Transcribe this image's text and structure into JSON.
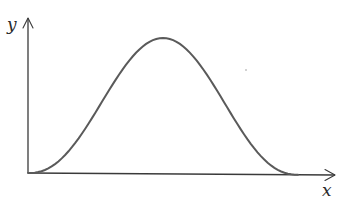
{
  "diagram": {
    "type": "function-plot",
    "axes": {
      "x_label": "x",
      "y_label": "y"
    },
    "curve": {
      "shape": "bell",
      "starts_at": "origin",
      "peak_position": "center",
      "returns_to_axis": "right",
      "samples": 80
    },
    "colors": {
      "axis": "#3a3a3a",
      "curve": "#5a5a5a",
      "label": "#2a2a2a",
      "background": "#ffffff"
    }
  }
}
